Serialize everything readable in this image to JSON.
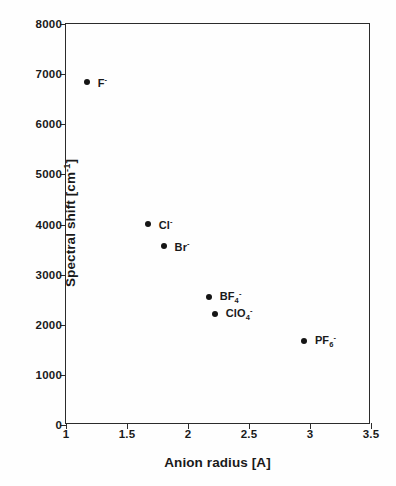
{
  "chart_data": {
    "type": "scatter",
    "title": "",
    "xlabel": "Anion radius [A]",
    "ylabel_parts": {
      "pre": "Spectral shift [cm",
      "sup": "-1",
      "post": "]"
    },
    "ylabel": "Spectral shift [cm-1]",
    "xlim": [
      1,
      3.5
    ],
    "ylim": [
      0,
      8000
    ],
    "xticks": [
      "1",
      "1.5",
      "2",
      "2.5",
      "3",
      "3.5"
    ],
    "xtick_values": [
      1,
      1.5,
      2,
      2.5,
      3,
      3.5
    ],
    "yticks": [
      "0",
      "1000",
      "2000",
      "3000",
      "4000",
      "5000",
      "6000",
      "7000",
      "8000"
    ],
    "ytick_values": [
      0,
      1000,
      2000,
      3000,
      4000,
      5000,
      6000,
      7000,
      8000
    ],
    "grid": false,
    "legend": "none",
    "marker": "filled-circle",
    "marker_color": "#151515",
    "points": [
      {
        "name": "F-",
        "label_pre": "F",
        "label_sub": "",
        "label_sup": "-",
        "x": 1.17,
        "y": 6840,
        "label_dx": 11,
        "label_dy": 0
      },
      {
        "name": "Cl-",
        "label_pre": "Cl",
        "label_sub": "",
        "label_sup": "-",
        "x": 1.67,
        "y": 4010,
        "label_dx": 11,
        "label_dy": 0
      },
      {
        "name": "Br-",
        "label_pre": "Br",
        "label_sub": "",
        "label_sup": "-",
        "x": 1.8,
        "y": 3570,
        "label_dx": 11,
        "label_dy": 0
      },
      {
        "name": "BF4-",
        "label_pre": "BF",
        "label_sub": "4",
        "label_sup": "-",
        "x": 2.17,
        "y": 2560,
        "label_dx": 11,
        "label_dy": 0
      },
      {
        "name": "ClO4-",
        "label_pre": "ClO",
        "label_sub": "4",
        "label_sup": "-",
        "x": 2.22,
        "y": 2220,
        "label_dx": 11,
        "label_dy": 0
      },
      {
        "name": "PF6-",
        "label_pre": "PF",
        "label_sub": "6",
        "label_sup": "-",
        "x": 2.95,
        "y": 1680,
        "label_dx": 11,
        "label_dy": 0
      }
    ]
  }
}
